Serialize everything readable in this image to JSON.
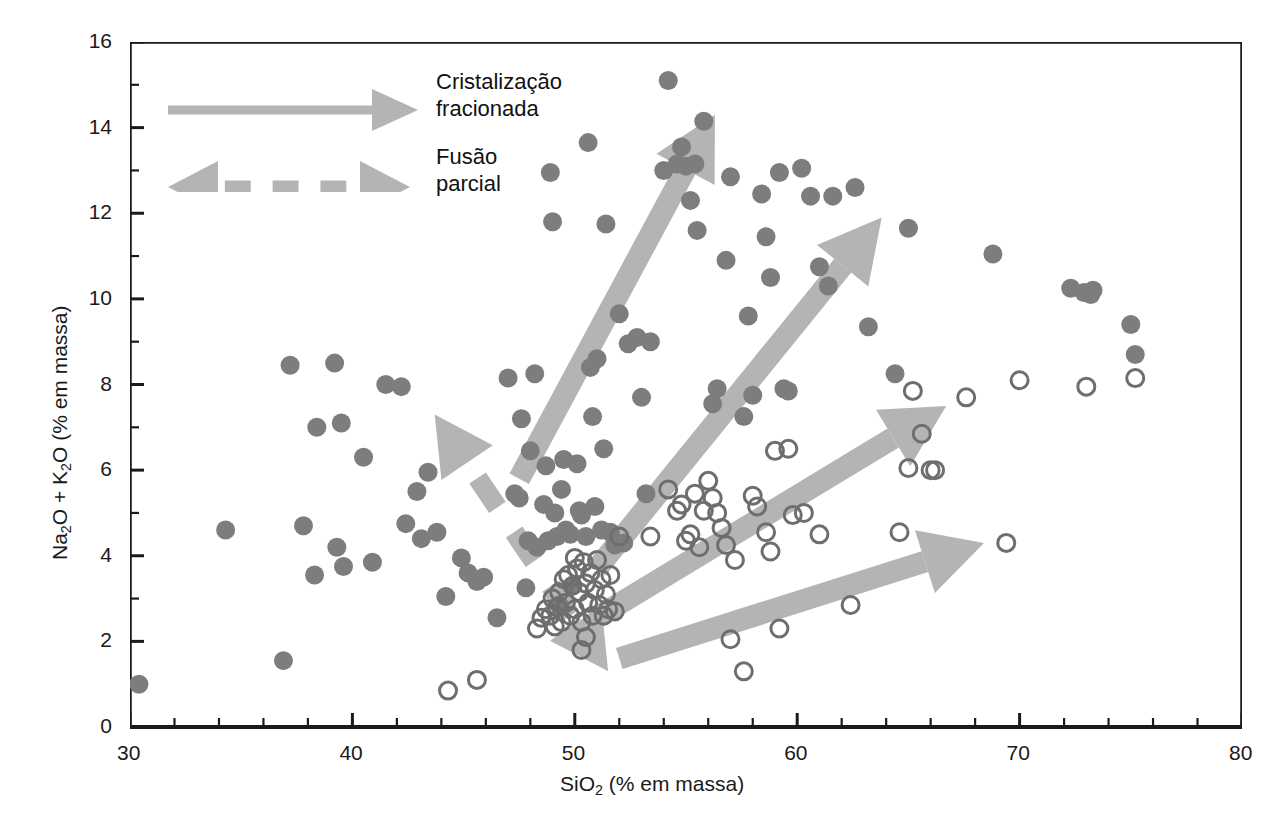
{
  "chart_data": {
    "type": "scatter",
    "title": "",
    "xlabel": "SiO2 (% em massa)",
    "xlabel_parts": {
      "pre": "SiO",
      "sub": "2",
      "post": " (% em massa)"
    },
    "ylabel": "Na2O + K2O (% em massa)",
    "ylabel_parts": {
      "a": "Na",
      "a_sub": "2",
      "b": "O + K",
      "b_sub": "2",
      "c": "O (% em massa)"
    },
    "xlim": [
      30,
      80
    ],
    "ylim": [
      0,
      16
    ],
    "xticks": [
      30,
      40,
      50,
      60,
      70,
      80
    ],
    "yticks": [
      0,
      2,
      4,
      6,
      8,
      10,
      12,
      14,
      16
    ],
    "x_minor_step": 2,
    "y_minor_step": 1,
    "grid": false,
    "legend_position": "top-left-inside",
    "series": [
      {
        "name": "alcalinas",
        "marker": "filled-circle",
        "color": "#7d7d7d",
        "points": [
          [
            30.4,
            1.0
          ],
          [
            34.3,
            4.6
          ],
          [
            36.9,
            1.55
          ],
          [
            37.2,
            8.45
          ],
          [
            37.8,
            4.7
          ],
          [
            38.3,
            3.55
          ],
          [
            38.4,
            7.0
          ],
          [
            39.2,
            8.5
          ],
          [
            39.3,
            4.2
          ],
          [
            39.5,
            7.1
          ],
          [
            39.6,
            3.75
          ],
          [
            40.5,
            6.3
          ],
          [
            40.9,
            3.85
          ],
          [
            41.5,
            8.0
          ],
          [
            42.2,
            7.95
          ],
          [
            42.4,
            4.75
          ],
          [
            42.9,
            5.5
          ],
          [
            43.1,
            4.4
          ],
          [
            43.4,
            5.95
          ],
          [
            43.8,
            4.55
          ],
          [
            44.2,
            3.05
          ],
          [
            44.9,
            3.95
          ],
          [
            45.2,
            3.6
          ],
          [
            45.6,
            3.4
          ],
          [
            45.9,
            3.5
          ],
          [
            46.5,
            2.55
          ],
          [
            47.0,
            8.15
          ],
          [
            47.3,
            5.45
          ],
          [
            47.5,
            5.35
          ],
          [
            47.6,
            7.2
          ],
          [
            47.8,
            3.25
          ],
          [
            47.9,
            4.35
          ],
          [
            48.0,
            6.45
          ],
          [
            48.2,
            8.25
          ],
          [
            48.3,
            4.2
          ],
          [
            48.6,
            5.2
          ],
          [
            48.7,
            6.1
          ],
          [
            48.8,
            4.35
          ],
          [
            48.9,
            12.95
          ],
          [
            49.0,
            11.8
          ],
          [
            49.1,
            5.0
          ],
          [
            49.2,
            4.45
          ],
          [
            49.3,
            2.85
          ],
          [
            49.4,
            5.55
          ],
          [
            49.5,
            6.25
          ],
          [
            49.6,
            4.6
          ],
          [
            49.8,
            4.5
          ],
          [
            49.9,
            3.3
          ],
          [
            50.1,
            6.15
          ],
          [
            50.2,
            5.05
          ],
          [
            50.3,
            4.95
          ],
          [
            50.5,
            4.45
          ],
          [
            50.6,
            13.65
          ],
          [
            50.7,
            8.4
          ],
          [
            50.8,
            7.25
          ],
          [
            50.9,
            5.15
          ],
          [
            51.0,
            8.6
          ],
          [
            51.2,
            4.6
          ],
          [
            51.3,
            6.5
          ],
          [
            51.4,
            11.75
          ],
          [
            51.6,
            4.55
          ],
          [
            51.8,
            4.25
          ],
          [
            52.0,
            9.65
          ],
          [
            52.2,
            4.3
          ],
          [
            52.4,
            8.95
          ],
          [
            52.8,
            9.1
          ],
          [
            53.0,
            7.7
          ],
          [
            53.2,
            5.45
          ],
          [
            53.4,
            9.0
          ],
          [
            54.0,
            13.0
          ],
          [
            54.2,
            15.1
          ],
          [
            54.6,
            13.15
          ],
          [
            54.8,
            13.55
          ],
          [
            55.0,
            13.1
          ],
          [
            55.2,
            12.3
          ],
          [
            55.4,
            13.15
          ],
          [
            55.5,
            11.6
          ],
          [
            55.8,
            14.15
          ],
          [
            56.2,
            7.55
          ],
          [
            56.4,
            7.9
          ],
          [
            56.8,
            10.9
          ],
          [
            57.0,
            12.85
          ],
          [
            57.6,
            7.25
          ],
          [
            57.8,
            9.6
          ],
          [
            58.0,
            7.75
          ],
          [
            58.4,
            12.45
          ],
          [
            58.6,
            11.45
          ],
          [
            58.8,
            10.5
          ],
          [
            59.2,
            12.95
          ],
          [
            59.4,
            7.9
          ],
          [
            59.6,
            7.85
          ],
          [
            60.2,
            13.05
          ],
          [
            60.6,
            12.4
          ],
          [
            61.0,
            10.75
          ],
          [
            61.4,
            10.3
          ],
          [
            61.6,
            12.4
          ],
          [
            62.6,
            12.6
          ],
          [
            63.2,
            9.35
          ],
          [
            64.4,
            8.25
          ],
          [
            65.0,
            11.65
          ],
          [
            68.8,
            11.05
          ],
          [
            72.3,
            10.25
          ],
          [
            72.9,
            10.15
          ],
          [
            73.3,
            10.2
          ],
          [
            73.2,
            10.1
          ],
          [
            75.0,
            9.4
          ],
          [
            75.2,
            8.7
          ]
        ]
      },
      {
        "name": "subalcalinas",
        "marker": "open-circle",
        "color": "#6e6e6e",
        "points": [
          [
            44.3,
            0.85
          ],
          [
            45.6,
            1.1
          ],
          [
            48.3,
            2.3
          ],
          [
            48.5,
            2.55
          ],
          [
            48.7,
            2.75
          ],
          [
            48.9,
            2.6
          ],
          [
            49.0,
            3.0
          ],
          [
            49.1,
            2.35
          ],
          [
            49.2,
            2.8
          ],
          [
            49.3,
            3.15
          ],
          [
            49.4,
            2.45
          ],
          [
            49.5,
            3.45
          ],
          [
            49.6,
            2.9
          ],
          [
            49.7,
            3.55
          ],
          [
            49.8,
            2.6
          ],
          [
            49.9,
            3.3
          ],
          [
            50.0,
            3.95
          ],
          [
            50.0,
            2.75
          ],
          [
            50.1,
            3.7
          ],
          [
            50.2,
            3.15
          ],
          [
            50.3,
            2.45
          ],
          [
            50.3,
            1.8
          ],
          [
            50.4,
            3.85
          ],
          [
            50.5,
            3.35
          ],
          [
            50.5,
            2.1
          ],
          [
            50.6,
            2.9
          ],
          [
            50.7,
            3.6
          ],
          [
            50.8,
            2.6
          ],
          [
            50.9,
            3.2
          ],
          [
            51.0,
            3.9
          ],
          [
            51.1,
            2.85
          ],
          [
            51.2,
            3.45
          ],
          [
            51.3,
            2.6
          ],
          [
            51.4,
            3.1
          ],
          [
            51.5,
            2.75
          ],
          [
            51.6,
            3.55
          ],
          [
            51.8,
            2.7
          ],
          [
            52.0,
            4.45
          ],
          [
            53.4,
            4.45
          ],
          [
            54.2,
            5.55
          ],
          [
            54.6,
            5.05
          ],
          [
            54.8,
            5.2
          ],
          [
            55.0,
            4.35
          ],
          [
            55.2,
            4.5
          ],
          [
            55.4,
            5.45
          ],
          [
            55.6,
            4.2
          ],
          [
            55.8,
            5.05
          ],
          [
            56.0,
            5.75
          ],
          [
            56.2,
            5.35
          ],
          [
            56.4,
            5.0
          ],
          [
            56.6,
            4.65
          ],
          [
            56.8,
            4.25
          ],
          [
            57.0,
            2.05
          ],
          [
            57.2,
            3.9
          ],
          [
            57.6,
            1.3
          ],
          [
            58.0,
            5.4
          ],
          [
            58.2,
            5.15
          ],
          [
            58.6,
            4.55
          ],
          [
            58.8,
            4.1
          ],
          [
            59.0,
            6.45
          ],
          [
            59.2,
            2.3
          ],
          [
            59.6,
            6.5
          ],
          [
            59.8,
            4.95
          ],
          [
            60.3,
            5.0
          ],
          [
            61.0,
            4.5
          ],
          [
            62.4,
            2.85
          ],
          [
            64.6,
            4.55
          ],
          [
            65.0,
            6.05
          ],
          [
            65.2,
            7.85
          ],
          [
            65.6,
            6.85
          ],
          [
            66.0,
            6.0
          ],
          [
            66.2,
            6.0
          ],
          [
            67.6,
            7.7
          ],
          [
            69.4,
            4.3
          ],
          [
            70.0,
            8.1
          ],
          [
            73.0,
            7.95
          ],
          [
            75.2,
            8.15
          ]
        ]
      }
    ],
    "annotations": [
      {
        "label": "Cristalização fracionada",
        "style": "solid-arrow",
        "from": [
          47.5,
          5.8
        ],
        "to": [
          56.3,
          14.3
        ]
      },
      {
        "label": "Cristalização fracionada",
        "style": "solid-arrow",
        "from": [
          51.0,
          3.7
        ],
        "to": [
          63.8,
          11.9
        ]
      },
      {
        "label": "Cristalização fracionada",
        "style": "solid-arrow",
        "from": [
          50.8,
          2.5
        ],
        "to": [
          66.7,
          7.5
        ]
      },
      {
        "label": "Cristalização fracionada",
        "style": "solid-arrow",
        "from": [
          52.0,
          1.6
        ],
        "to": [
          68.4,
          4.3
        ]
      },
      {
        "label": "Fusão parcial",
        "style": "dashed-double-arrow",
        "from": [
          51.5,
          1.3
        ],
        "to": [
          43.7,
          7.3
        ]
      }
    ]
  },
  "legend": {
    "items": [
      {
        "id": "fractional-crystallization",
        "label": "Cristalização\nfracionada",
        "style": "solid-arrow"
      },
      {
        "id": "partial-melting",
        "label": "Fusão\nparcial",
        "style": "dashed-double-arrow"
      }
    ]
  },
  "axis": {
    "x_title_pre": "SiO",
    "x_title_sub": "2",
    "x_title_post": " (% em massa)",
    "y_title_a": "Na",
    "y_title_a_sub": "2",
    "y_title_b": "O + K",
    "y_title_b_sub": "2",
    "y_title_c": "O (% em massa)",
    "x_ticklabels": [
      "30",
      "40",
      "50",
      "60",
      "70",
      "80"
    ],
    "y_ticklabels": [
      "0",
      "2",
      "4",
      "6",
      "8",
      "10",
      "12",
      "14",
      "16"
    ]
  },
  "colors": {
    "filled_marker": "#7d7d7d",
    "open_marker": "#6e6e6e",
    "arrow": "#b4b4b4",
    "axis": "#1a1a1a",
    "background": "#ffffff"
  }
}
